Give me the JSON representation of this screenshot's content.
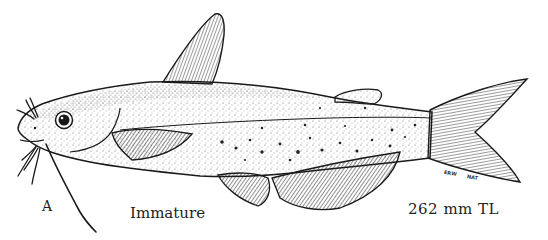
{
  "figure": {
    "panel_letter": "A",
    "life_stage": "Immature",
    "length": "262 mm TL",
    "artist_initials": [
      "ERW",
      "NAT"
    ]
  },
  "colors": {
    "ink": "#1a1a1a",
    "background": "#ffffff",
    "stipple": "#444444"
  }
}
